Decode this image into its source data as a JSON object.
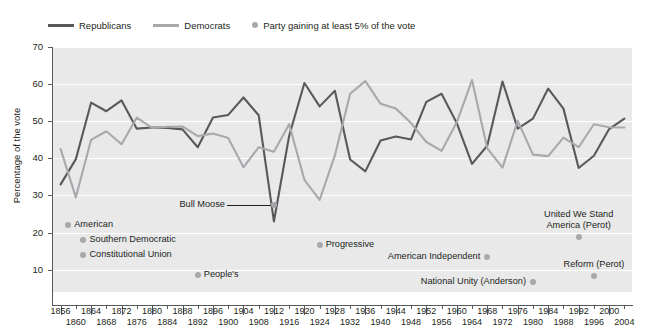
{
  "legend": {
    "items": [
      {
        "label": "Republicans",
        "type": "line",
        "color": "#58595b",
        "name": "legend-republicans"
      },
      {
        "label": "Democrats",
        "type": "line",
        "color": "#a7a9ac",
        "name": "legend-democrats"
      },
      {
        "label": "Party gaining at least 5% of the vote",
        "type": "dot",
        "color": "#a7a9ac",
        "name": "legend-third-party"
      }
    ]
  },
  "axes": {
    "ylabel": "Percentage of the vote",
    "yticks": [
      10,
      20,
      30,
      40,
      50,
      60,
      70
    ],
    "ylim": [
      4,
      70
    ],
    "xlim": [
      1854,
      2006
    ],
    "xticks": [
      1856,
      1860,
      1864,
      1868,
      1872,
      1876,
      1880,
      1884,
      1888,
      1892,
      1896,
      1900,
      1904,
      1908,
      1912,
      1916,
      1920,
      1924,
      1928,
      1932,
      1936,
      1940,
      1944,
      1948,
      1952,
      1956,
      1960,
      1964,
      1968,
      1972,
      1976,
      1980,
      1984,
      1988,
      1992,
      1996,
      2000,
      2004
    ]
  },
  "annotations": [
    {
      "label": "American",
      "x": 1858,
      "y": 22,
      "dot": true,
      "anchor": "left",
      "name": "annot-american"
    },
    {
      "label": "Southern Democratic",
      "x": 1862,
      "y": 18,
      "dot": true,
      "anchor": "left",
      "name": "annot-southern-democratic"
    },
    {
      "label": "Constitutional Union",
      "x": 1862,
      "y": 14,
      "dot": true,
      "anchor": "left",
      "name": "annot-constitutional-union"
    },
    {
      "label": "People's",
      "x": 1892,
      "y": 8.5,
      "dot": true,
      "anchor": "left",
      "name": "annot-peoples"
    },
    {
      "label": "Bull Moose",
      "x": 1912,
      "y": 27.4,
      "dot": true,
      "anchor": "leader",
      "name": "annot-bull-moose"
    },
    {
      "label": "Progressive",
      "x": 1924,
      "y": 16.6,
      "dot": true,
      "anchor": "left",
      "name": "annot-progressive"
    },
    {
      "label": "American Independent",
      "x": 1968,
      "y": 13.5,
      "dot": true,
      "anchor": "right",
      "name": "annot-american-independent"
    },
    {
      "label": "National Unity (Anderson)",
      "x": 1980,
      "y": 6.6,
      "dot": true,
      "anchor": "right",
      "name": "annot-national-unity"
    },
    {
      "label": "United We Stand\nAmerica (Perot)",
      "x": 1992,
      "y": 18.9,
      "dot": true,
      "anchor": "center-above",
      "name": "annot-united-we-stand"
    },
    {
      "label": "Reform (Perot)",
      "x": 1996,
      "y": 8.4,
      "dot": true,
      "anchor": "center-above",
      "name": "annot-reform-perot"
    }
  ],
  "chart_data": {
    "type": "line",
    "title": "",
    "xlabel": "",
    "ylabel": "Percentage of the vote",
    "ylim": [
      4,
      70
    ],
    "xlim": [
      1854,
      2006
    ],
    "grid": true,
    "legend_position": "top-left",
    "x": [
      1856,
      1860,
      1864,
      1868,
      1872,
      1876,
      1880,
      1884,
      1888,
      1892,
      1896,
      1900,
      1904,
      1908,
      1912,
      1916,
      1920,
      1924,
      1928,
      1932,
      1936,
      1940,
      1944,
      1948,
      1952,
      1956,
      1960,
      1964,
      1968,
      1972,
      1976,
      1980,
      1984,
      1988,
      1992,
      1996,
      2000,
      2004
    ],
    "series": [
      {
        "name": "Republicans",
        "color": "#58595b",
        "values": [
          33,
          39.8,
          55,
          52.7,
          55.6,
          48,
          48.3,
          48.2,
          47.8,
          43,
          51,
          51.7,
          56.4,
          51.6,
          23,
          46.1,
          60.3,
          54,
          58.2,
          39.7,
          36.5,
          44.8,
          45.9,
          45.1,
          55.2,
          57.4,
          49.5,
          38.5,
          43.4,
          60.7,
          48,
          50.7,
          58.8,
          53.4,
          37.4,
          40.7,
          47.9,
          50.7
        ]
      },
      {
        "name": "Democrats",
        "color": "#a7a9ac",
        "values": [
          42.5,
          29.5,
          45,
          47.3,
          43.8,
          51,
          48.2,
          48.5,
          48.6,
          46,
          46.7,
          45.5,
          37.6,
          43,
          41.8,
          49.2,
          34.2,
          28.8,
          40.8,
          57.4,
          60.8,
          54.7,
          53.4,
          49.5,
          44.4,
          42,
          49.7,
          61.1,
          42.7,
          37.5,
          50.1,
          41,
          40.6,
          45.6,
          43,
          49.2,
          48.4,
          48.3
        ]
      }
    ],
    "third_party_markers": [
      {
        "party": "American",
        "year": 1856,
        "value": 21.6
      },
      {
        "party": "Southern Democratic",
        "year": 1860,
        "value": 18.1
      },
      {
        "party": "Constitutional Union",
        "year": 1860,
        "value": 12.6
      },
      {
        "party": "People's",
        "year": 1892,
        "value": 8.5
      },
      {
        "party": "Bull Moose",
        "year": 1912,
        "value": 27.4
      },
      {
        "party": "Progressive",
        "year": 1924,
        "value": 16.6
      },
      {
        "party": "American Independent",
        "year": 1968,
        "value": 13.5
      },
      {
        "party": "National Unity (Anderson)",
        "year": 1980,
        "value": 6.6
      },
      {
        "party": "United We Stand America (Perot)",
        "year": 1992,
        "value": 18.9
      },
      {
        "party": "Reform (Perot)",
        "year": 1996,
        "value": 8.4
      }
    ]
  }
}
